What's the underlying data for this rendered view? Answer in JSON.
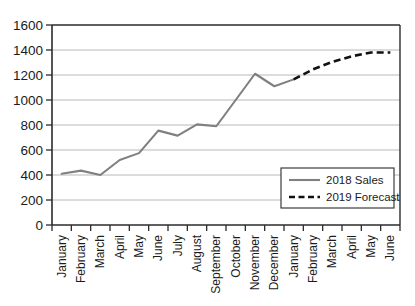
{
  "chart_data": {
    "type": "line",
    "title": "",
    "xlabel": "",
    "ylabel": "",
    "ylim": [
      0,
      1600
    ],
    "ytick_step": 200,
    "ytick_labels": [
      "0",
      "200",
      "400",
      "600",
      "800",
      "1000",
      "1200",
      "1400",
      "1600"
    ],
    "grid": true,
    "legend_position": "inside-bottom-right",
    "categories": [
      "January",
      "February",
      "March",
      "April",
      "May",
      "June",
      "July",
      "August",
      "September",
      "October",
      "November",
      "December",
      "January",
      "February",
      "March",
      "April",
      "May",
      "June"
    ],
    "series": [
      {
        "name": "2018 Sales",
        "style": "solid",
        "color": "#808080",
        "values": [
          410,
          435,
          400,
          520,
          575,
          755,
          715,
          805,
          790,
          1000,
          1210,
          1110,
          1165,
          null,
          null,
          null,
          null,
          null
        ]
      },
      {
        "name": "2019 Forecast",
        "style": "dashed",
        "color": "#111111",
        "values": [
          null,
          null,
          null,
          null,
          null,
          null,
          null,
          null,
          null,
          null,
          null,
          null,
          1165,
          1245,
          1305,
          1350,
          1380,
          1380
        ]
      }
    ]
  },
  "legend": {
    "items": [
      {
        "label": "2018 Sales",
        "swatch": "solid-line-swatch",
        "color": "#808080"
      },
      {
        "label": "2019 Forecast",
        "swatch": "dashed-line-swatch",
        "color": "#111111"
      }
    ]
  },
  "axes": {
    "y": {
      "ticks": [
        "1600",
        "1400",
        "1200",
        "1000",
        "800",
        "600",
        "400",
        "200",
        "0"
      ]
    },
    "x": {
      "ticks": [
        "January",
        "February",
        "March",
        "April",
        "May",
        "June",
        "July",
        "August",
        "September",
        "October",
        "November",
        "December",
        "January",
        "February",
        "March",
        "April",
        "May",
        "June"
      ]
    }
  }
}
